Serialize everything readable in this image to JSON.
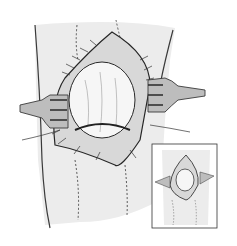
{
  "image": {
    "kind": "surgical line illustration",
    "subject": "open knee exposure held by two retractors, with smaller inset view",
    "colors": {
      "background": "#ffffff",
      "skin": "#ececec",
      "ink": "#2a2a2a",
      "retractor": "#bdbdbd",
      "joint": "#f6f6f6"
    },
    "inset": {
      "present": true,
      "position": "bottom-right"
    }
  }
}
